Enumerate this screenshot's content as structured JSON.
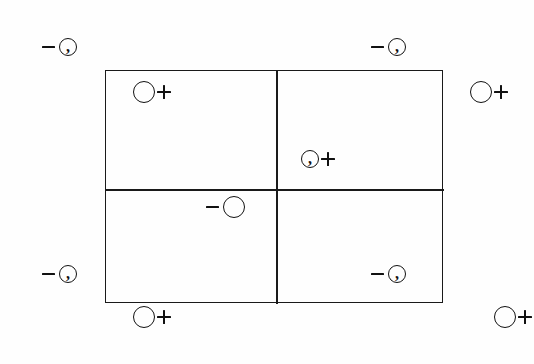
{
  "figure": {
    "background_color": "#fefefe",
    "line_color": "#1a1a1a",
    "ink_color": "#111111",
    "box": {
      "x": 105,
      "y": 70,
      "width": 338,
      "height": 233,
      "vertical_divider_x": 275,
      "horizontal_divider_y": 188,
      "quadrants": [
        "top-left",
        "top-right",
        "bottom-left",
        "bottom-right"
      ]
    },
    "markers": [
      {
        "id": "marker-outside-top-left",
        "order": "minus-then-circle",
        "sign": "−",
        "sign_name": "minus",
        "circle": "small-comma",
        "inner_glyph": ",",
        "x": 42,
        "y": 38,
        "location": "outside-top-left"
      },
      {
        "id": "marker-outside-top-right",
        "order": "minus-then-circle",
        "sign": "−",
        "sign_name": "minus",
        "circle": "small-comma",
        "inner_glyph": ",",
        "x": 371,
        "y": 38,
        "location": "outside-top-right"
      },
      {
        "id": "marker-quadrant-top-left",
        "order": "circle-then-plus",
        "sign": "+",
        "sign_name": "plus",
        "circle": "large-open",
        "inner_glyph": "",
        "x": 133,
        "y": 81,
        "location": "inside-top-left-quadrant"
      },
      {
        "id": "marker-outside-right-upper",
        "order": "circle-then-plus",
        "sign": "+",
        "sign_name": "plus",
        "circle": "large-open",
        "inner_glyph": "",
        "x": 470,
        "y": 81,
        "location": "outside-right-upper"
      },
      {
        "id": "marker-quadrant-top-right",
        "order": "circle-then-plus",
        "sign": "+",
        "sign_name": "plus",
        "circle": "small-comma",
        "inner_glyph": ",",
        "x": 301,
        "y": 150,
        "location": "inside-top-right-quadrant"
      },
      {
        "id": "marker-center-bottom-left",
        "order": "minus-then-circle",
        "sign": "−",
        "sign_name": "minus",
        "circle": "large-open",
        "inner_glyph": "",
        "x": 206,
        "y": 196,
        "location": "inside-bottom-left-quadrant"
      },
      {
        "id": "marker-outside-bottom-left",
        "order": "minus-then-circle",
        "sign": "−",
        "sign_name": "minus",
        "circle": "small-comma",
        "inner_glyph": ",",
        "x": 42,
        "y": 265,
        "location": "outside-bottom-left"
      },
      {
        "id": "marker-quadrant-bottom-right",
        "order": "minus-then-circle",
        "sign": "−",
        "sign_name": "minus",
        "circle": "small-comma",
        "inner_glyph": ",",
        "x": 371,
        "y": 265,
        "location": "inside-bottom-right-quadrant"
      },
      {
        "id": "marker-below-bottom-left",
        "order": "circle-then-plus",
        "sign": "+",
        "sign_name": "plus",
        "circle": "large-open",
        "inner_glyph": "",
        "x": 133,
        "y": 306,
        "location": "outside-below-bottom-left"
      },
      {
        "id": "marker-below-bottom-right",
        "order": "circle-then-plus",
        "sign": "+",
        "sign_name": "plus",
        "circle": "large-open",
        "inner_glyph": "",
        "x": 494,
        "y": 306,
        "location": "outside-below-bottom-right"
      }
    ]
  }
}
